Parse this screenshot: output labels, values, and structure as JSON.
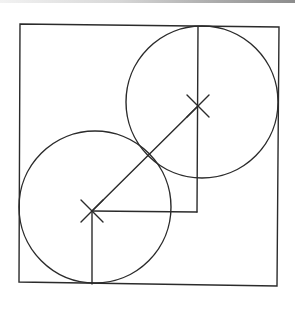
{
  "diagram": {
    "type": "geometric-construction",
    "canvas": {
      "width": 295,
      "height": 309,
      "background": "#ffffff"
    },
    "stroke_color": "#2b2b2b",
    "stroke_width": 1.4,
    "scan_band": {
      "height": 3,
      "color_left": "#f2f2f2",
      "color_right": "#8c8c8c"
    },
    "square": {
      "points": [
        [
          20,
          24
        ],
        [
          279,
          27
        ],
        [
          277,
          286
        ],
        [
          19,
          282
        ]
      ]
    },
    "circles": [
      {
        "id": "upper-right-circle",
        "cx": 202,
        "cy": 102,
        "r": 76
      },
      {
        "id": "lower-left-circle",
        "cx": 95,
        "cy": 207,
        "r": 76
      }
    ],
    "center_marks": [
      {
        "id": "upper-center-mark",
        "x": 198,
        "y": 106,
        "arm": 11
      },
      {
        "id": "lower-center-mark",
        "x": 92,
        "y": 211,
        "arm": 11
      }
    ],
    "segments": [
      {
        "id": "center-to-center-line",
        "x1": 92,
        "y1": 211,
        "x2": 198,
        "y2": 106
      },
      {
        "id": "vertical-line-upper",
        "x1": 198,
        "y1": 27,
        "x2": 197,
        "y2": 212
      },
      {
        "id": "horizontal-line",
        "x1": 92,
        "y1": 211,
        "x2": 197,
        "y2": 212
      },
      {
        "id": "vertical-line-lower",
        "x1": 92,
        "y1": 211,
        "x2": 92,
        "y2": 284
      }
    ],
    "tangent_point": {
      "x": 147,
      "y": 156
    }
  }
}
